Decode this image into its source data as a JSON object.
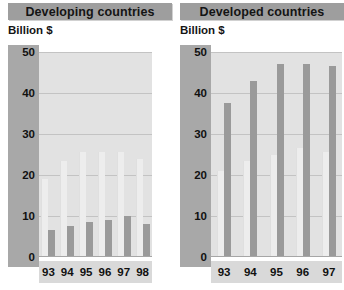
{
  "chart_data": [
    {
      "type": "bar",
      "title": "Developing countries",
      "ylabel": "Billion $",
      "xlabel": "",
      "categories": [
        "93",
        "94",
        "95",
        "96",
        "97",
        "98"
      ],
      "yticks": [
        0,
        10,
        20,
        30,
        40,
        50
      ],
      "ylim": [
        0,
        50
      ],
      "grid": true,
      "legend": "none",
      "series": [
        {
          "name": "light",
          "color": "#ededed",
          "values": [
            19,
            23.5,
            25.5,
            25.5,
            25.5,
            24
          ]
        },
        {
          "name": "dark",
          "color": "#9a9a9a",
          "values": [
            6.5,
            7.5,
            8.5,
            9,
            10,
            8
          ]
        }
      ]
    },
    {
      "type": "bar",
      "title": "Developed countries",
      "ylabel": "Billion $",
      "xlabel": "",
      "categories": [
        "93",
        "94",
        "95",
        "96",
        "97"
      ],
      "yticks": [
        0,
        10,
        20,
        30,
        40,
        50
      ],
      "ylim": [
        0,
        50
      ],
      "grid": true,
      "legend": "none",
      "note": "right edge of panel is cropped by the screenshot",
      "series": [
        {
          "name": "light",
          "color": "#ededed",
          "values": [
            21,
            23.5,
            25,
            26.5,
            25.5
          ]
        },
        {
          "name": "dark",
          "color": "#9a9a9a",
          "values": [
            37.5,
            43,
            47,
            47,
            46.5
          ]
        }
      ]
    }
  ],
  "panels": [
    {
      "title": "Developing countries",
      "unit": "Billion $",
      "yticks": [
        "50",
        "40",
        "30",
        "20",
        "10",
        "0"
      ],
      "xticks": [
        "93",
        "94",
        "95",
        "96",
        "97",
        "98"
      ]
    },
    {
      "title": "Developed countries",
      "unit": "Billion $",
      "yticks": [
        "50",
        "40",
        "30",
        "20",
        "10",
        "0"
      ],
      "xticks": [
        "93",
        "94",
        "95",
        "96",
        "97"
      ]
    }
  ],
  "colors": {
    "title_bar": "#9e9e9e",
    "axis_strip": "#a8a8a8",
    "plot_background": "#e2e2e2",
    "gridline": "#c3c3c3",
    "bar_light": "#ededed",
    "bar_dark": "#9a9a9a",
    "xaxis_strip": "#d9d9d9"
  }
}
